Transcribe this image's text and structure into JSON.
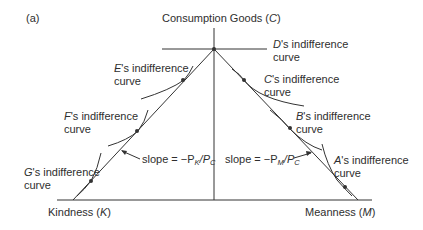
{
  "figure": {
    "panel_label": "(a)",
    "y_axis": {
      "label_text": "Consumption Goods (",
      "label_var": "C",
      "label_close": ")"
    },
    "x_axis_left": {
      "label_text": "Kindness (",
      "label_var": "K",
      "label_close": ")"
    },
    "x_axis_right": {
      "label_text": "Meanness (",
      "label_var": "M",
      "label_close": ")"
    },
    "curves": [
      {
        "person": "D",
        "line1": "'s indifference",
        "line2": "curve"
      },
      {
        "person": "E",
        "line1": "'s indifference",
        "line2": "curve"
      },
      {
        "person": "C",
        "line1": "'s indifference",
        "line2": "curve"
      },
      {
        "person": "F",
        "line1": "'s indifference",
        "line2": "curve"
      },
      {
        "person": "B",
        "line1": "'s indifference",
        "line2": "curve"
      },
      {
        "person": "G",
        "line1": "'s indifference",
        "line2": "curve"
      },
      {
        "person": "A",
        "line1": "'s indifference",
        "line2": "curve"
      }
    ],
    "slope_left": {
      "prefix": "slope = −P",
      "sub1": "K",
      "mid": "/P",
      "sub2": "C"
    },
    "slope_right": {
      "prefix": "slope = −P",
      "sub1": "M",
      "mid": "/P",
      "sub2": "C"
    }
  }
}
